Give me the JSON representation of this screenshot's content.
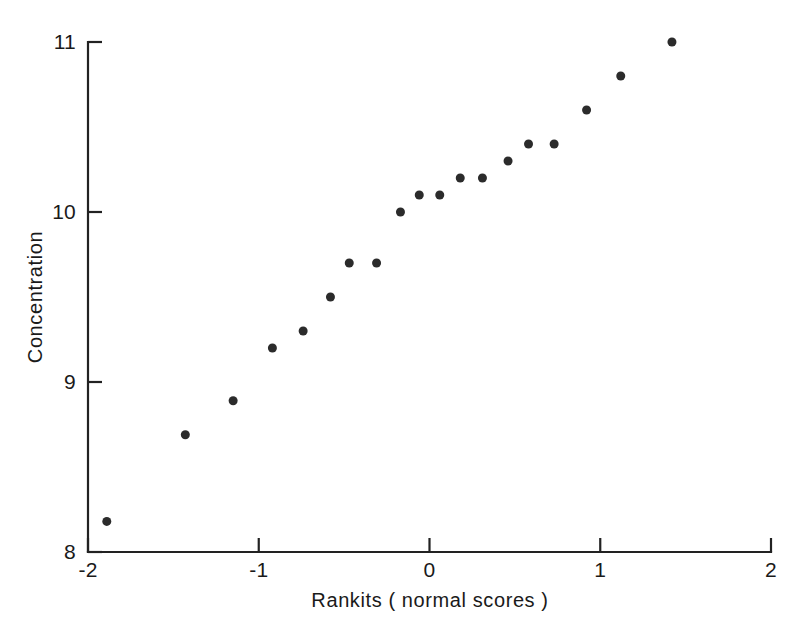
{
  "chart_data": {
    "type": "scatter",
    "title": "",
    "subtitle": "",
    "xlabel": "Rankits ( normal scores )",
    "ylabel": "Concentration",
    "xlim": [
      -2,
      2
    ],
    "ylim": [
      8,
      11
    ],
    "xticks": [
      -2,
      -1,
      0,
      1,
      2
    ],
    "xtick_labels": [
      "-2",
      "-1",
      "0",
      "1",
      "2"
    ],
    "yticks": [
      8,
      9,
      10,
      11
    ],
    "ytick_labels": [
      "8",
      "9",
      "10",
      "11"
    ],
    "grid": false,
    "legend": null,
    "legend_position": "none",
    "marker": "filled-circle",
    "marker_color": "#2b2b2b",
    "marker_size_px": 9,
    "axis_color": "#222222",
    "background_color": "#ffffff",
    "n_points": 20,
    "x": [
      -1.89,
      -1.43,
      -1.15,
      -0.92,
      -0.74,
      -0.58,
      -0.47,
      -0.31,
      -0.17,
      -0.06,
      0.06,
      0.18,
      0.31,
      0.46,
      0.58,
      0.73,
      0.92,
      1.12,
      1.42
    ],
    "y": [
      8.18,
      8.69,
      8.89,
      9.2,
      9.3,
      9.5,
      9.7,
      9.7,
      10.0,
      10.1,
      10.1,
      10.2,
      10.2,
      10.3,
      10.4,
      10.4,
      10.6,
      10.8,
      11.0
    ],
    "points": [
      {
        "x": -1.89,
        "y": 8.18
      },
      {
        "x": -1.43,
        "y": 8.69
      },
      {
        "x": -1.15,
        "y": 8.89
      },
      {
        "x": -0.92,
        "y": 9.2
      },
      {
        "x": -0.74,
        "y": 9.3
      },
      {
        "x": -0.58,
        "y": 9.5
      },
      {
        "x": -0.47,
        "y": 9.7
      },
      {
        "x": -0.31,
        "y": 9.7
      },
      {
        "x": -0.17,
        "y": 10.0
      },
      {
        "x": -0.06,
        "y": 10.1
      },
      {
        "x": 0.06,
        "y": 10.1
      },
      {
        "x": 0.18,
        "y": 10.2
      },
      {
        "x": 0.31,
        "y": 10.2
      },
      {
        "x": 0.46,
        "y": 10.3
      },
      {
        "x": 0.58,
        "y": 10.4
      },
      {
        "x": 0.73,
        "y": 10.4
      },
      {
        "x": 0.92,
        "y": 10.6
      },
      {
        "x": 1.12,
        "y": 10.8
      },
      {
        "x": 1.42,
        "y": 11.0
      }
    ]
  },
  "figure": {
    "plot_area": {
      "left_px": 88,
      "right_px": 771,
      "top_px": 42,
      "bottom_px": 552
    }
  }
}
